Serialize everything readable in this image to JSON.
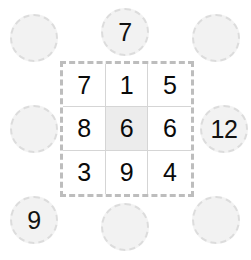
{
  "puzzle": {
    "type": "number-grid-sum-puzzle",
    "grid": {
      "rows": 3,
      "columns": 3,
      "cells": [
        [
          {
            "value": "7",
            "highlighted": false
          },
          {
            "value": "1",
            "highlighted": false
          },
          {
            "value": "5",
            "highlighted": false
          }
        ],
        [
          {
            "value": "8",
            "highlighted": false
          },
          {
            "value": "6",
            "highlighted": true
          },
          {
            "value": "6",
            "highlighted": false
          }
        ],
        [
          {
            "value": "3",
            "highlighted": false
          },
          {
            "value": "9",
            "highlighted": false
          },
          {
            "value": "4",
            "highlighted": false
          }
        ]
      ]
    },
    "slots": [
      {
        "position": "top-left",
        "value": "",
        "filled": false
      },
      {
        "position": "top-center",
        "value": "7",
        "filled": true
      },
      {
        "position": "top-right",
        "value": "",
        "filled": false
      },
      {
        "position": "middle-left",
        "value": "",
        "filled": false
      },
      {
        "position": "middle-right",
        "value": "12",
        "filled": true
      },
      {
        "position": "bottom-left",
        "value": "9",
        "filled": true
      },
      {
        "position": "bottom-center",
        "value": "",
        "filled": false
      },
      {
        "position": "bottom-right",
        "value": "",
        "filled": false
      }
    ]
  },
  "colors": {
    "background": "#ffffff",
    "slot_fill": "#f2f2f2",
    "slot_border": "#dcdcdc",
    "grid_border": "#bdbdbd",
    "cell_border": "#d5d5d5",
    "cell_highlight": "#ececec",
    "digit": "#0a0a0a"
  }
}
